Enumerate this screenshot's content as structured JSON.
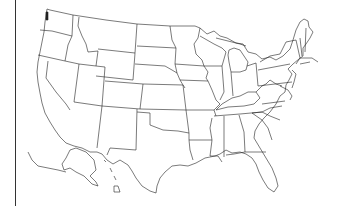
{
  "map": {
    "title": "",
    "subject": "United States state boundaries outline map",
    "style": {
      "stroke": "#222222",
      "background": "#ffffff",
      "frame_line": "#333333"
    },
    "regions": [
      "Washington",
      "Oregon",
      "California",
      "Idaho",
      "Nevada",
      "Montana",
      "Wyoming",
      "Utah",
      "Arizona",
      "Colorado",
      "New Mexico",
      "North Dakota",
      "South Dakota",
      "Nebraska",
      "Kansas",
      "Oklahoma",
      "Texas",
      "Minnesota",
      "Iowa",
      "Missouri",
      "Arkansas",
      "Louisiana",
      "Wisconsin",
      "Illinois",
      "Michigan",
      "Indiana",
      "Ohio",
      "Kentucky",
      "Tennessee",
      "Mississippi",
      "Alabama",
      "Georgia",
      "Florida",
      "South Carolina",
      "North Carolina",
      "Virginia",
      "West Virginia",
      "Pennsylvania",
      "New York",
      "Maryland",
      "Delaware",
      "New Jersey",
      "Connecticut",
      "Rhode Island",
      "Massachusetts",
      "Vermont",
      "New Hampshire",
      "Maine",
      "Alaska",
      "Hawaii"
    ]
  }
}
